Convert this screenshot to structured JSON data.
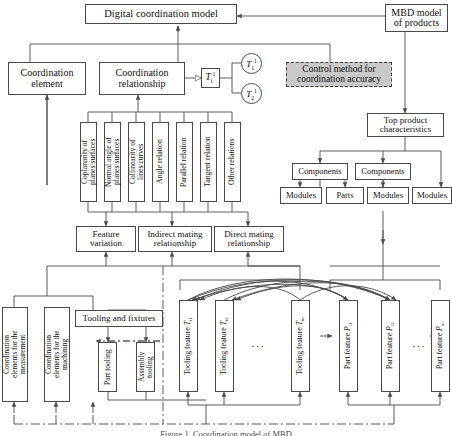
{
  "figure": {
    "caption": "Figure 1. Coordination model of MBD"
  },
  "nodes": {
    "digital_model": "Digital coordination model",
    "mbd_model": "MBD model\nof products",
    "coordination_element": "Coordination\nelement",
    "coordination_relationship": "Coordination\nrelationship",
    "control_method": "Control method for\ncoordination accuracy",
    "top_product": "Top product\ncharacteristics",
    "tooling_fixtures": "Tooling and fixtures"
  },
  "tensors": {
    "source": "T i 1",
    "branch1": "T 1 1",
    "branch2": "T 2 1"
  },
  "relations": [
    "Coplanarity of\nplanes/surfaces",
    "Normal angle of\nplanes/surfaces",
    "Collinearity of\nlines/curves",
    "Angle relation",
    "Parallel relation",
    "Tangent relation",
    "Other relations"
  ],
  "mating": [
    "Feature\nvariation",
    "Indirect mating\nrelationship",
    "Direct mating\nrelationship"
  ],
  "hierarchy": {
    "components": [
      "Components",
      "Components"
    ],
    "leaves": [
      "Modules",
      "Parts",
      "Modules",
      "Modules"
    ]
  },
  "coordination_elements": [
    "Coordination\nelements for the\nmeasurement",
    "Coordination\nelements for the\nmachining"
  ],
  "tooling": [
    "Part tooling",
    "Assembly tooling"
  ],
  "tooling_features": [
    {
      "label": "Tooling feature",
      "sym": "T",
      "sub": "t1"
    },
    {
      "label": "Tooling feature",
      "sym": "T",
      "sub": "t2"
    },
    {
      "label": "Tooling feature",
      "sym": "T",
      "sub": "tn"
    }
  ],
  "part_features": [
    {
      "label": "Part feature",
      "sym": "P",
      "sub": "i1"
    },
    {
      "label": "Part feature",
      "sym": "P",
      "sub": "i2"
    },
    {
      "label": "Part feature",
      "sym": "P",
      "sub": "in"
    }
  ],
  "ellipsis": "···",
  "colors": {
    "line": "#4a4a4a",
    "shaded_fill": "#c9c9c9",
    "text": "#111111"
  }
}
